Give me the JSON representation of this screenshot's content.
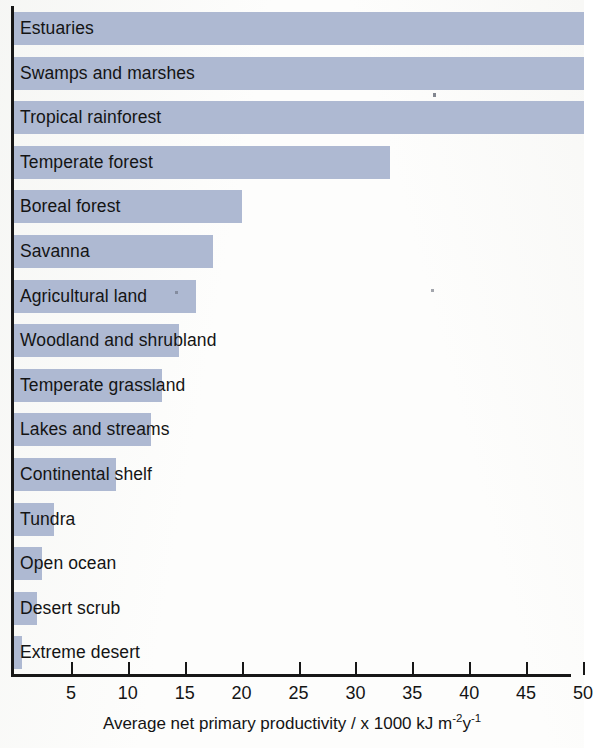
{
  "chart_data": {
    "type": "bar",
    "orientation": "horizontal",
    "title": "",
    "xlabel": "Average net primary productivity / x 1000 kJ m-2y-1",
    "ylabel": "",
    "xlim": [
      0,
      50
    ],
    "xticks": [
      5,
      10,
      15,
      20,
      25,
      30,
      35,
      40,
      45,
      50
    ],
    "grid": false,
    "legend": null,
    "units": "x 1000 kJ m^-2 y^-1",
    "categories": [
      "Estuaries",
      "Swamps and marshes",
      "Tropical rainforest",
      "Temperate forest",
      "Boreal forest",
      "Savanna",
      "Agricultural land",
      "Woodland and shrubland",
      "Temperate grassland",
      "Lakes and streams",
      "Continental shelf",
      "Tundra",
      "Open ocean",
      "Desert scrub",
      "Extreme desert"
    ],
    "values": [
      50,
      50,
      50,
      33,
      20,
      17.5,
      16,
      14.5,
      13,
      12,
      9,
      3.5,
      2.5,
      2,
      0.7
    ],
    "clipped": [
      true,
      true,
      true,
      false,
      false,
      false,
      false,
      false,
      false,
      false,
      false,
      false,
      false,
      false,
      false
    ],
    "bar_color": "#aeb9d2",
    "axis_color": "#171717",
    "text_color": "#141414"
  },
  "axis": {
    "title": "Average net primary productivity / x 1000 kJ m",
    "sup_1": "-2",
    "mid": "y",
    "sup_2": "-1",
    "ticks": [
      {
        "value": "5"
      },
      {
        "value": "10"
      },
      {
        "value": "15"
      },
      {
        "value": "20"
      },
      {
        "value": "25"
      },
      {
        "value": "30"
      },
      {
        "value": "35"
      },
      {
        "value": "40"
      },
      {
        "value": "45"
      },
      {
        "value": "50"
      }
    ]
  },
  "bars": [
    {
      "label": "Estuaries"
    },
    {
      "label": "Swamps and marshes"
    },
    {
      "label": "Tropical rainforest"
    },
    {
      "label": "Temperate forest"
    },
    {
      "label": "Boreal forest"
    },
    {
      "label": "Savanna"
    },
    {
      "label": "Agricultural land"
    },
    {
      "label": "Woodland and shrubland"
    },
    {
      "label": "Temperate grassland"
    },
    {
      "label": "Lakes and streams"
    },
    {
      "label": "Continental shelf"
    },
    {
      "label": "Tundra"
    },
    {
      "label": "Open ocean"
    },
    {
      "label": "Desert scrub"
    },
    {
      "label": "Extreme desert"
    }
  ]
}
